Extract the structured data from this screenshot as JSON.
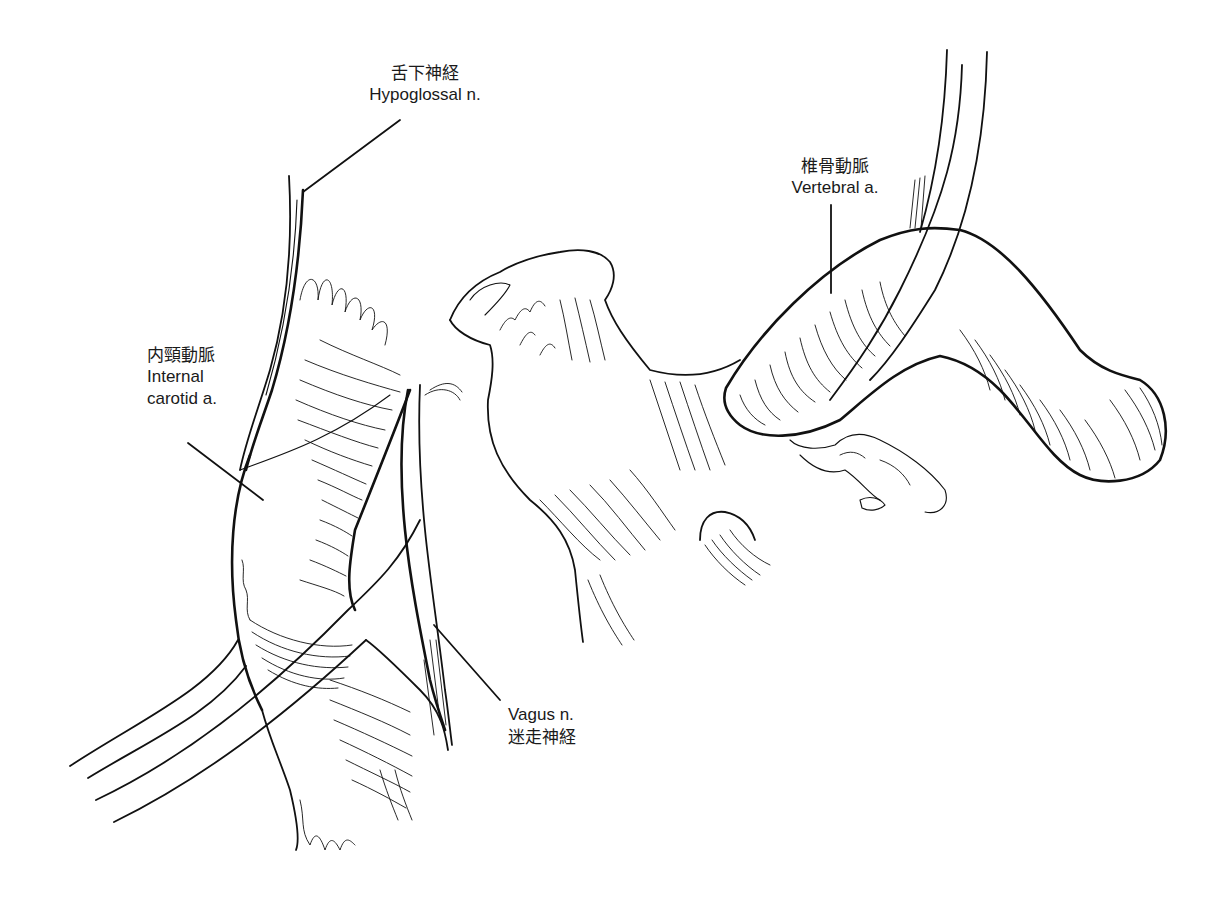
{
  "figure": {
    "type": "anatomical line drawing",
    "background": "#ffffff",
    "ink_color": "#111111"
  },
  "labels": [
    {
      "id": "hypoglossal",
      "ja": "舌下神経",
      "en": "Hypoglossal n."
    },
    {
      "id": "vertebral",
      "ja": "椎骨動脈",
      "en": "Vertebral a."
    },
    {
      "id": "internal_carotid",
      "ja": "内頸動脈",
      "en_line1": "Internal",
      "en_line2": "carotid a."
    },
    {
      "id": "vagus",
      "en": "Vagus n.",
      "ja": "迷走神経"
    }
  ]
}
